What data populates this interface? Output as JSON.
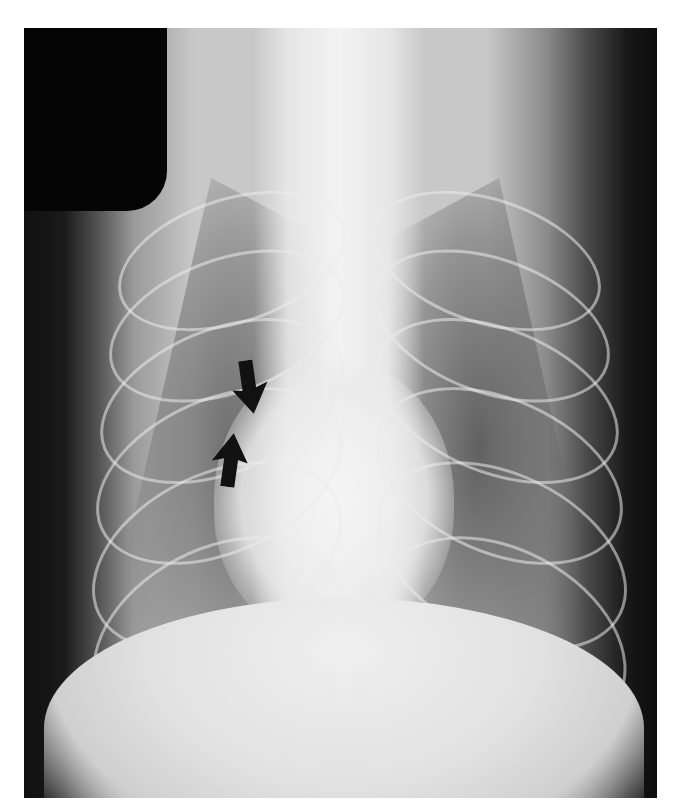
{
  "image": {
    "description": "Dorsoventral thoracic radiograph with two black arrows pointing toward each other at the cardiac silhouette",
    "colors": {
      "background": "#ffffff",
      "film_dark": "#101010",
      "soft_tissue": "#c8c8c8",
      "bone_bright": "#efefef",
      "arrow": "#111111"
    },
    "annotations": [
      {
        "type": "arrow",
        "direction": "down",
        "icon": "arrow-down-icon"
      },
      {
        "type": "arrow",
        "direction": "up",
        "icon": "arrow-up-icon"
      }
    ],
    "corner_marker": "black rounded rectangle (top-left film marker)"
  }
}
